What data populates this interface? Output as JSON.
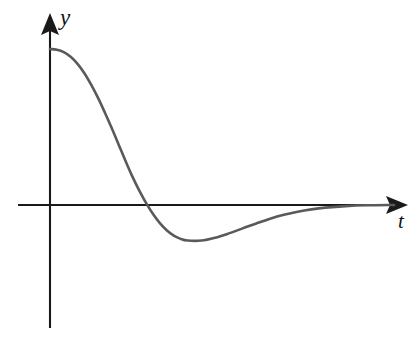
{
  "figure": {
    "background_color": "#ffffff",
    "width": 419,
    "height": 347
  },
  "axes": {
    "color": "#1a1a1a",
    "line_width": 2,
    "origin": {
      "x": 50,
      "y": 205
    },
    "horizontal": {
      "name": "t-axis",
      "label": "t",
      "x_start": 18,
      "x_end": 408,
      "y": 205,
      "arrow": "right"
    },
    "vertical": {
      "name": "y-axis",
      "label": "y",
      "y_start": 328,
      "y_end": 14,
      "x": 50,
      "arrow": "up"
    }
  },
  "curve": {
    "name": "damped-response-curve",
    "color": "#5a5a5a",
    "line_width": 2.6,
    "description": "Overdamped-to-oscillatory decay: starts positive with horizontal tangent, falls through zero, reaches a negative minimum, then rises asymptotically back to zero."
  },
  "chart_data": {
    "type": "line",
    "title": "",
    "subtitle": "",
    "xlabel": "t",
    "ylabel": "y",
    "grid": false,
    "legend": null,
    "axis_arrows": {
      "x": "right",
      "y": "up"
    },
    "xlim": [
      -0.25,
      5.0
    ],
    "ylim": [
      -0.45,
      1.25
    ],
    "annotations": [],
    "series": [
      {
        "name": "y(t)",
        "x": [
          0.0,
          0.1,
          0.2,
          0.3,
          0.4,
          0.5,
          0.6,
          0.7,
          0.8,
          0.9,
          1.0,
          1.1,
          1.2,
          1.3,
          1.4,
          1.5,
          1.6,
          1.7,
          1.8,
          1.9,
          2.0,
          2.2,
          2.4,
          2.6,
          2.8,
          3.0,
          3.2,
          3.4,
          3.6,
          3.8,
          4.0,
          4.3,
          4.6,
          5.0
        ],
        "y": [
          1.0,
          0.995,
          0.98,
          0.95,
          0.905,
          0.845,
          0.77,
          0.685,
          0.59,
          0.49,
          0.385,
          0.28,
          0.18,
          0.09,
          0.01,
          -0.06,
          -0.118,
          -0.163,
          -0.196,
          -0.217,
          -0.228,
          -0.228,
          -0.21,
          -0.182,
          -0.15,
          -0.118,
          -0.088,
          -0.063,
          -0.043,
          -0.028,
          -0.017,
          -0.007,
          -0.002,
          0.0
        ]
      }
    ],
    "key_points": {
      "initial_value": {
        "t": 0.0,
        "y": 1.0,
        "px": [
          50,
          49
        ]
      },
      "zero_crossing": {
        "t": 1.41,
        "y": 0.0,
        "px": [
          147,
          205
        ]
      },
      "minimum": {
        "t": 2.1,
        "y": -0.23,
        "px": [
          192,
          235
        ]
      },
      "asymptote": {
        "t_onward": 4.2,
        "y": 0.0,
        "px_from": [
          310,
          205
        ]
      }
    }
  }
}
